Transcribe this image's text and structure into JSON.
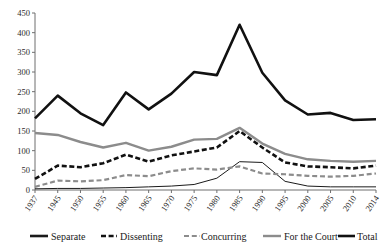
{
  "chart_data": {
    "type": "line",
    "title": "",
    "xlabel": "",
    "ylabel": "",
    "ylim": [
      0,
      450
    ],
    "ytick_step": 50,
    "grid": false,
    "legend_position": "bottom",
    "yticks": [
      "0",
      "50",
      "100",
      "150",
      "200",
      "250",
      "300",
      "350",
      "400",
      "450"
    ],
    "categories": [
      "1937",
      "1945",
      "1950",
      "1955",
      "1960",
      "1965",
      "1970",
      "1975",
      "1980",
      "1985",
      "1990",
      "1995",
      "2000",
      "2005",
      "2010",
      "2014"
    ],
    "series": [
      {
        "name": "Separate",
        "style": "solid-thin",
        "color": "#1a1a1a",
        "values": [
          3,
          4,
          4,
          5,
          6,
          8,
          10,
          14,
          30,
          72,
          70,
          22,
          10,
          8,
          8,
          8
        ]
      },
      {
        "name": "Dissenting",
        "style": "dashed-thick",
        "color": "#111111",
        "values": [
          28,
          62,
          58,
          68,
          90,
          72,
          88,
          98,
          108,
          150,
          108,
          70,
          60,
          58,
          55,
          62
        ]
      },
      {
        "name": "Concurring",
        "style": "dashed-medium",
        "color": "#8c8c8c",
        "values": [
          8,
          24,
          22,
          25,
          38,
          35,
          48,
          55,
          52,
          60,
          42,
          40,
          36,
          34,
          36,
          42
        ]
      },
      {
        "name": "For the Court",
        "style": "solid-thick-gray",
        "color": "#8c8c8c",
        "values": [
          145,
          140,
          122,
          108,
          120,
          100,
          110,
          128,
          130,
          158,
          118,
          92,
          78,
          74,
          72,
          74
        ]
      },
      {
        "name": "Total",
        "style": "solid-thick-black",
        "color": "#111111",
        "values": [
          182,
          240,
          195,
          165,
          248,
          205,
          245,
          300,
          292,
          420,
          298,
          228,
          192,
          196,
          178,
          180
        ]
      }
    ]
  },
  "legend": {
    "entries": [
      {
        "label": "Separate"
      },
      {
        "label": "Dissenting"
      },
      {
        "label": "Concurring"
      },
      {
        "label": "For the Court"
      },
      {
        "label": "Total"
      }
    ]
  }
}
